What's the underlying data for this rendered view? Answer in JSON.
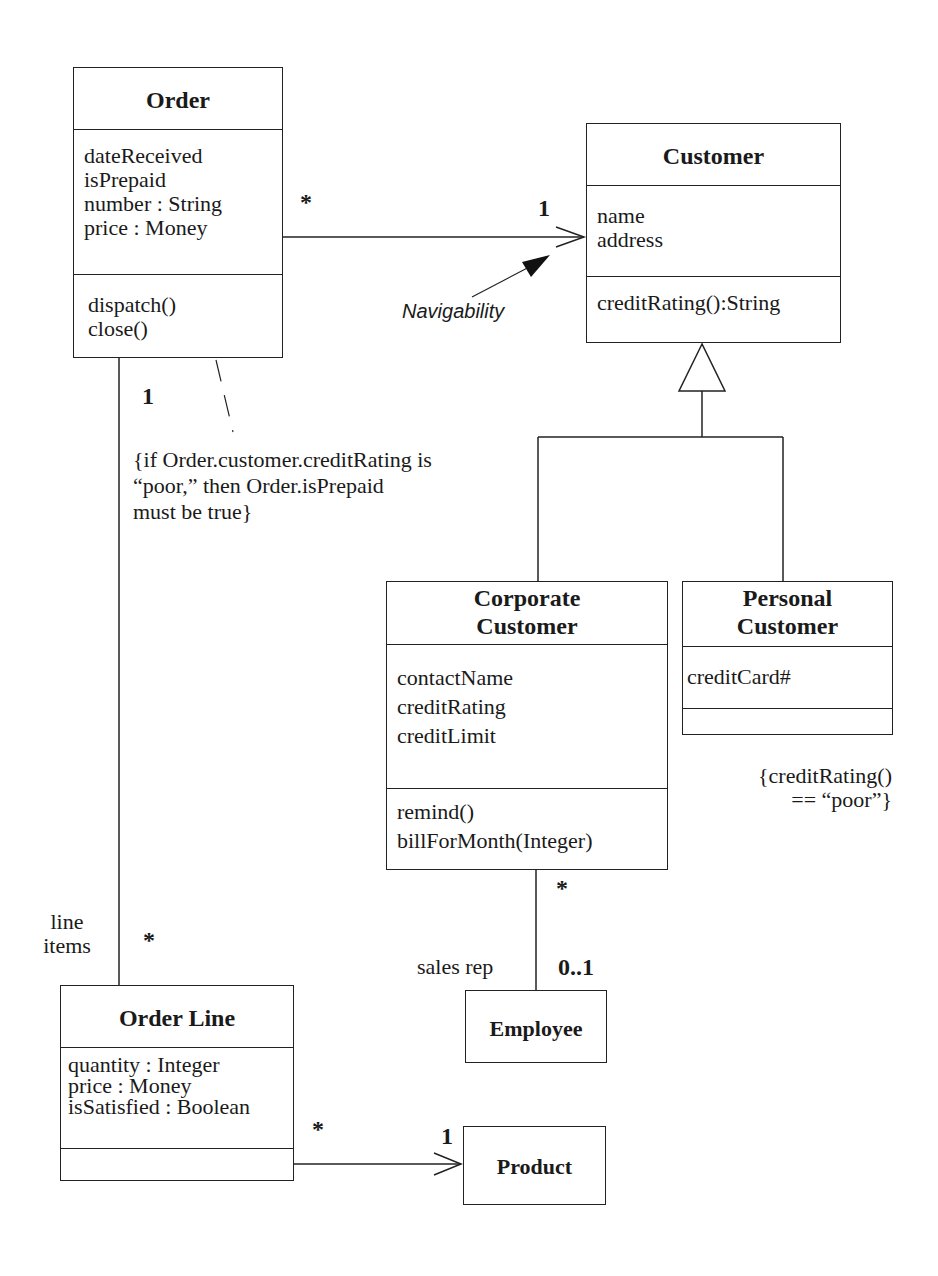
{
  "diagram": {
    "type": "UML class diagram",
    "classes": {
      "order": {
        "name": "Order",
        "attributes": [
          "dateReceived",
          "isPrepaid",
          "number : String",
          "price : Money"
        ],
        "operations": [
          "dispatch()",
          "close()"
        ]
      },
      "customer": {
        "name": "Customer",
        "attributes": [
          "name",
          "address"
        ],
        "operations": [
          "creditRating():String"
        ]
      },
      "corporate_customer": {
        "name_line1": "Corporate",
        "name_line2": "Customer",
        "attributes": [
          "contactName",
          "creditRating",
          "creditLimit"
        ],
        "operations": [
          "remind()",
          "billForMonth(Integer)"
        ]
      },
      "personal_customer": {
        "name_line1": "Personal",
        "name_line2": "Customer",
        "attributes": [
          "creditCard#"
        ],
        "operations": []
      },
      "employee": {
        "name": "Employee"
      },
      "order_line": {
        "name": "Order Line",
        "attributes": [
          "quantity : Integer",
          "price : Money",
          "isSatisfied : Boolean"
        ],
        "operations": []
      },
      "product": {
        "name": "Product"
      }
    },
    "associations": {
      "order_customer": {
        "source_mult": "*",
        "target_mult": "1"
      },
      "order_orderline": {
        "source_mult": "1",
        "target_mult": "*",
        "role_line1": "line",
        "role_line2": "items"
      },
      "corporate_employee": {
        "source_mult": "*",
        "target_mult": "0..1",
        "role": "sales rep"
      },
      "orderline_product": {
        "source_mult": "*",
        "target_mult": "1"
      }
    },
    "annotations": {
      "navigability": "Navigability",
      "order_constraint": [
        "{if Order.customer.creditRating is",
        "“poor,” then Order.isPrepaid",
        "must be true}"
      ],
      "personal_constraint": [
        "{creditRating()",
        "== “poor”}"
      ]
    },
    "colors": {
      "line": "#222222",
      "background": "#ffffff",
      "text": "#1a1a1a"
    }
  }
}
